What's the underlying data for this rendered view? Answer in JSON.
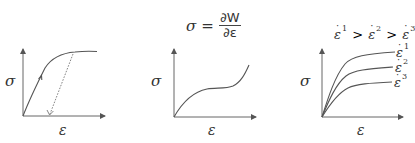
{
  "panels": [
    {
      "id": "elastoplastic",
      "y_label": "σ",
      "x_label": "ε",
      "features": [
        "loading-curve-with-arrow",
        "dashed-unloading-line-with-arrow"
      ]
    },
    {
      "id": "hyperelastic",
      "formula": {
        "lhs": "σ",
        "equals": "=",
        "numerator": "∂W",
        "denominator": "∂ε"
      },
      "y_label": "σ",
      "x_label": "ε"
    },
    {
      "id": "viscoelastic",
      "relation": {
        "base": "ε",
        "dot": "·",
        "sup1": "1",
        "sup2": "2",
        "sup3": "3",
        "gt": ">"
      },
      "curve_labels": [
        {
          "base": "ε",
          "dot": "·",
          "sup": "1"
        },
        {
          "base": "ε",
          "dot": "·",
          "sup": "2"
        },
        {
          "base": "ε",
          "dot": "·",
          "sup": "3"
        }
      ],
      "y_label": "σ",
      "x_label": "ε"
    }
  ],
  "colors": {
    "line": "#555555",
    "axis": "#666666",
    "text": "#333333"
  }
}
